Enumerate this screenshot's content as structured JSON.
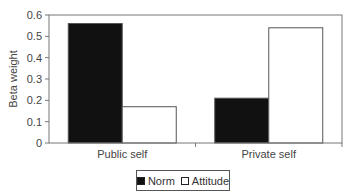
{
  "chart_data": {
    "type": "bar",
    "title": "",
    "xlabel": "",
    "ylabel": "Beta weight",
    "ylim": [
      0,
      0.6
    ],
    "yticks": [
      "0",
      "0.1",
      "0.2",
      "0.3",
      "0.4",
      "0.5",
      "0.6"
    ],
    "categories": [
      "Public self",
      "Private self"
    ],
    "series": [
      {
        "name": "Norm",
        "color": "#111111",
        "values": [
          0.56,
          0.21
        ]
      },
      {
        "name": "Attitude",
        "color": "#ffffff",
        "values": [
          0.17,
          0.54
        ]
      }
    ],
    "grid": false,
    "legend_position": "bottom"
  },
  "legend": {
    "norm_label": "Norm",
    "attitude_label": "Attitude"
  }
}
